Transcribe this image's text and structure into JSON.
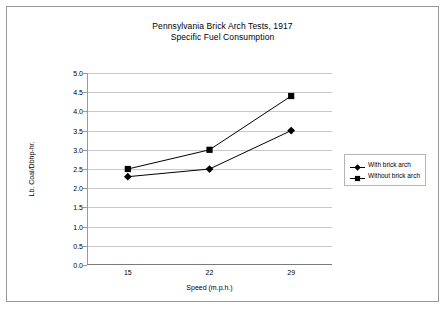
{
  "chart_data": {
    "type": "line",
    "title": "Pennsylvania Brick Arch Tests, 1917",
    "subtitle": "Specific Fuel Consumption",
    "xlabel": "Speed (m.p.h.)",
    "ylabel": "Lb. Coal/Dbhp-hr.",
    "categories": [
      "15",
      "22",
      "29"
    ],
    "ylim": [
      0.0,
      5.0
    ],
    "ytick_step": 0.5,
    "yticks": [
      "5.0",
      "4.5",
      "4.0",
      "3.5",
      "3.0",
      "2.5",
      "2.0",
      "1.5",
      "1.0",
      "0.5",
      "0.0"
    ],
    "grid": "horizontal",
    "legend_position": "right",
    "series": [
      {
        "name": "With brick arch",
        "marker": "diamond",
        "color": "#000000",
        "values": [
          2.3,
          2.5,
          3.5
        ]
      },
      {
        "name": "Without brick arch",
        "marker": "square",
        "color": "#000000",
        "values": [
          2.5,
          3.0,
          4.4
        ]
      }
    ]
  },
  "colors": {
    "border": "#999999",
    "gridline": "#c9c9c9",
    "axis": "#7a7a7a",
    "series": "#000000",
    "background": "#ffffff"
  }
}
